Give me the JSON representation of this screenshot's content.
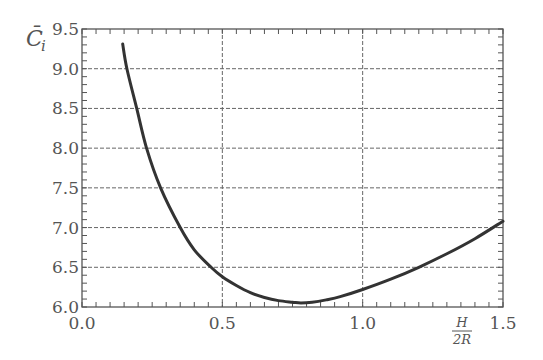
{
  "chart_data": {
    "type": "line",
    "title": "",
    "xlabel": "H/2R",
    "xlabel_numerator": "H",
    "xlabel_denominator": "2R",
    "ylabel": "C̄i",
    "ylabel_main": "C̄",
    "ylabel_sub": "i",
    "xlim": [
      0.0,
      1.5
    ],
    "ylim": [
      6.0,
      9.5
    ],
    "x_ticks": [
      "0.0",
      "0.5",
      "1.0",
      "1.5"
    ],
    "y_ticks": [
      "6.0",
      "6.5",
      "7.0",
      "7.5",
      "8.0",
      "8.5",
      "9.0",
      "9.5"
    ],
    "grid": true,
    "grid_style": "dashed",
    "legend": null,
    "series": [
      {
        "name": "C̄i",
        "color": "#333333",
        "x": [
          0.145,
          0.16,
          0.195,
          0.23,
          0.28,
          0.35,
          0.4,
          0.46,
          0.5,
          0.55,
          0.6,
          0.65,
          0.7,
          0.75,
          0.78,
          0.82,
          0.87,
          0.92,
          1.0,
          1.1,
          1.2,
          1.3,
          1.4,
          1.5
        ],
        "y": [
          9.31,
          9.0,
          8.5,
          8.0,
          7.5,
          7.0,
          6.72,
          6.5,
          6.38,
          6.27,
          6.18,
          6.12,
          6.08,
          6.06,
          6.05,
          6.06,
          6.09,
          6.13,
          6.22,
          6.35,
          6.5,
          6.67,
          6.86,
          7.08
        ]
      }
    ]
  }
}
